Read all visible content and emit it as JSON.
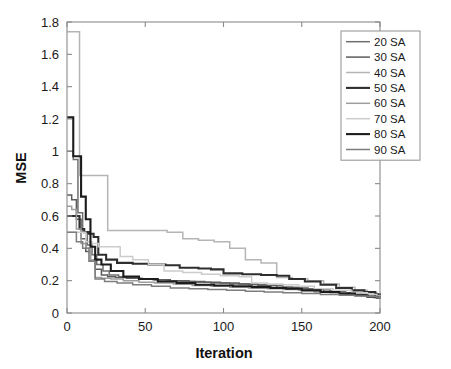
{
  "figure": {
    "background_color": "#ffffff",
    "axis_color": "#8a8a8a",
    "text_color": "#1a1a1a"
  },
  "chart_data": {
    "type": "line",
    "title": "",
    "subtitle": "",
    "xlabel": "Iteration",
    "ylabel": "MSE",
    "xlim": [
      0,
      200
    ],
    "ylim": [
      0,
      1.8
    ],
    "xticks": [
      0,
      50,
      100,
      150,
      200
    ],
    "xtick_labels": [
      "0",
      "50",
      "100",
      "150",
      "200"
    ],
    "yticks": [
      0,
      0.2,
      0.4,
      0.6,
      0.8,
      1.0,
      1.2,
      1.4,
      1.6,
      1.8
    ],
    "ytick_labels": [
      "0",
      "0.2",
      "0.4",
      "0.6",
      "0.8",
      "1",
      "1.2",
      "1.4",
      "1.6",
      "1.8"
    ],
    "grid": false,
    "legend_position": "top-right",
    "line_style": "step-post",
    "series": [
      {
        "name": "20 SA",
        "color": "#6f6f6f",
        "width": 1.5,
        "x": [
          0,
          4,
          7,
          10,
          13,
          16,
          19,
          23,
          27,
          33,
          40,
          48,
          56,
          64,
          72,
          82,
          92,
          104,
          116,
          128,
          138,
          148,
          158,
          168,
          178,
          188,
          196,
          200
        ],
        "y": [
          1.0,
          0.95,
          0.62,
          0.5,
          0.42,
          0.36,
          0.3,
          0.26,
          0.235,
          0.225,
          0.215,
          0.21,
          0.205,
          0.2,
          0.195,
          0.19,
          0.185,
          0.18,
          0.175,
          0.17,
          0.16,
          0.15,
          0.145,
          0.135,
          0.125,
          0.115,
          0.105,
          0.1
        ]
      },
      {
        "name": "30 SA",
        "color": "#5c5c5c",
        "width": 1.5,
        "x": [
          0,
          3,
          6,
          9,
          12,
          15,
          18,
          22,
          26,
          31,
          38,
          46,
          55,
          66,
          78,
          88,
          98,
          110,
          122,
          134,
          144,
          154,
          164,
          174,
          184,
          192,
          198,
          200
        ],
        "y": [
          0.73,
          0.7,
          0.58,
          0.46,
          0.38,
          0.32,
          0.27,
          0.235,
          0.225,
          0.22,
          0.215,
          0.21,
          0.205,
          0.2,
          0.195,
          0.19,
          0.185,
          0.18,
          0.17,
          0.16,
          0.155,
          0.145,
          0.135,
          0.125,
          0.115,
          0.11,
          0.105,
          0.1
        ]
      },
      {
        "name": "40 SA",
        "color": "#b5b5b5",
        "width": 1.5,
        "x": [
          0,
          5,
          8,
          12,
          16,
          20,
          26,
          34,
          44,
          54,
          64,
          74,
          84,
          94,
          104,
          114,
          124,
          134,
          144,
          154,
          164,
          174,
          184,
          192,
          198,
          200
        ],
        "y": [
          1.74,
          1.74,
          0.85,
          0.85,
          0.85,
          0.85,
          0.51,
          0.51,
          0.51,
          0.51,
          0.5,
          0.46,
          0.45,
          0.44,
          0.4,
          0.33,
          0.31,
          0.22,
          0.21,
          0.2,
          0.18,
          0.16,
          0.14,
          0.125,
          0.11,
          0.105
        ]
      },
      {
        "name": "50 SA",
        "color": "#2e2e2e",
        "width": 2.1,
        "x": [
          0,
          2,
          5,
          8,
          11,
          14,
          17,
          20,
          25,
          32,
          42,
          52,
          63,
          72,
          84,
          92,
          100,
          112,
          124,
          134,
          142,
          152,
          162,
          172,
          182,
          190,
          197,
          200
        ],
        "y": [
          0.6,
          0.6,
          0.6,
          0.52,
          0.5,
          0.49,
          0.47,
          0.36,
          0.33,
          0.31,
          0.305,
          0.3,
          0.295,
          0.28,
          0.275,
          0.27,
          0.245,
          0.24,
          0.235,
          0.23,
          0.21,
          0.195,
          0.175,
          0.155,
          0.14,
          0.13,
          0.115,
          0.11
        ]
      },
      {
        "name": "60 SA",
        "color": "#9e9e9e",
        "width": 1.5,
        "x": [
          0,
          3,
          6,
          9,
          12,
          15,
          18,
          22,
          28,
          36,
          46,
          56,
          68,
          80,
          92,
          104,
          116,
          128,
          138,
          148,
          158,
          168,
          178,
          188,
          196,
          200
        ],
        "y": [
          0.66,
          0.64,
          0.52,
          0.43,
          0.4,
          0.33,
          0.22,
          0.215,
          0.21,
          0.2,
          0.19,
          0.185,
          0.18,
          0.17,
          0.165,
          0.16,
          0.155,
          0.15,
          0.145,
          0.14,
          0.13,
          0.125,
          0.115,
          0.105,
          0.095,
          0.09
        ]
      },
      {
        "name": "70 SA",
        "color": "#cccccc",
        "width": 1.5,
        "x": [
          0,
          4,
          8,
          12,
          16,
          20,
          25,
          30,
          34,
          42,
          52,
          62,
          74,
          86,
          98,
          110,
          118,
          128,
          138,
          148,
          158,
          170,
          182,
          192,
          198,
          200
        ],
        "y": [
          0.5,
          0.5,
          0.5,
          0.44,
          0.43,
          0.41,
          0.41,
          0.41,
          0.35,
          0.33,
          0.3,
          0.26,
          0.25,
          0.24,
          0.23,
          0.225,
          0.185,
          0.18,
          0.175,
          0.165,
          0.15,
          0.14,
          0.125,
          0.115,
          0.105,
          0.1
        ]
      },
      {
        "name": "80 SA",
        "color": "#1c1c1c",
        "width": 2.1,
        "x": [
          0,
          2,
          4,
          6,
          9,
          12,
          15,
          18,
          22,
          28,
          36,
          46,
          58,
          70,
          82,
          94,
          106,
          118,
          130,
          140,
          150,
          162,
          174,
          184,
          192,
          198,
          200
        ],
        "y": [
          1.21,
          1.21,
          0.97,
          0.97,
          0.72,
          0.58,
          0.41,
          0.33,
          0.3,
          0.26,
          0.225,
          0.21,
          0.195,
          0.185,
          0.175,
          0.17,
          0.165,
          0.16,
          0.155,
          0.15,
          0.14,
          0.13,
          0.12,
          0.11,
          0.1,
          0.095,
          0.09
        ]
      },
      {
        "name": "90 SA",
        "color": "#7d7d7d",
        "width": 1.5,
        "x": [
          0,
          3,
          6,
          10,
          14,
          18,
          24,
          32,
          42,
          54,
          66,
          78,
          90,
          102,
          114,
          126,
          138,
          150,
          162,
          174,
          184,
          192,
          198,
          200
        ],
        "y": [
          0.5,
          0.5,
          0.44,
          0.4,
          0.32,
          0.21,
          0.195,
          0.185,
          0.175,
          0.165,
          0.155,
          0.15,
          0.145,
          0.14,
          0.135,
          0.13,
          0.125,
          0.12,
          0.115,
          0.11,
          0.105,
          0.1,
          0.095,
          0.09
        ]
      }
    ]
  }
}
